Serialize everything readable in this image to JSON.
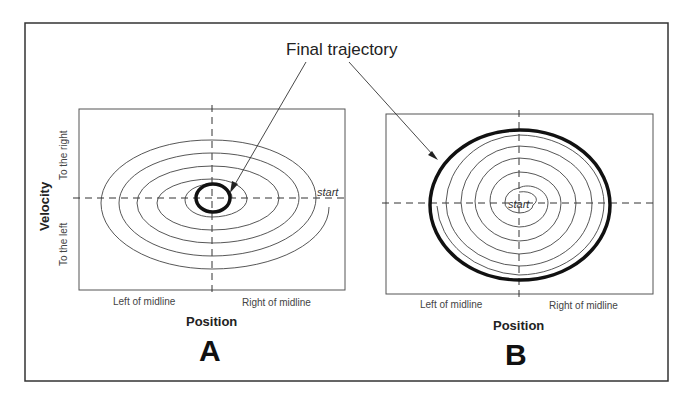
{
  "annotation": {
    "text": "Final trajectory"
  },
  "panels": [
    {
      "letter": "A",
      "x_axis": {
        "title": "Position",
        "left_label": "Left of midline",
        "right_label": "Right of midline"
      },
      "y_axis": {
        "title": "Velocity",
        "top_label": "To the right",
        "bottom_label": "To the left"
      },
      "start_label": "start",
      "description": "Spiral trajectory starting at outer right and converging inward to a small bold limit cycle at center"
    },
    {
      "letter": "B",
      "x_axis": {
        "title": "Position",
        "left_label": "Left of midline",
        "right_label": "Right of midline"
      },
      "start_label": "start",
      "description": "Spiral trajectory starting at center and expanding outward to a large bold limit cycle"
    }
  ],
  "colors": {
    "line": "#333333",
    "bold_line": "#111111",
    "background": "#ffffff"
  }
}
